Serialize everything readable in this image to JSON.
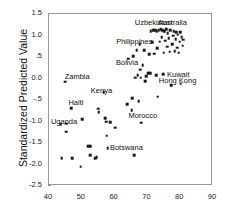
{
  "chart_data": {
    "type": "scatter",
    "title": "",
    "xlabel": "",
    "ylabel": "Standardized Predicted Value",
    "xlim": [
      40,
      90
    ],
    "ylim": [
      -2.5,
      1.5
    ],
    "xticks": [
      "40",
      "50",
      "60",
      "70",
      "80",
      "90"
    ],
    "xtick_values": [
      40,
      50,
      60,
      70,
      80,
      90
    ],
    "yticks": [
      "1.5",
      "1.0",
      ".5",
      "0.0",
      "-.5",
      "-1.0",
      "-1.5",
      "-2.0",
      "-2.5"
    ],
    "ytick_values": [
      1.5,
      1.0,
      0.5,
      0.0,
      -0.5,
      -1.0,
      -1.5,
      -2.0,
      -2.5
    ],
    "grid": false,
    "legend": false,
    "marker_color": "#1a1a1a",
    "frame_color": "#9a9a9a",
    "points": [
      {
        "x": 43.6,
        "y": -1.06
      },
      {
        "x": 43.9,
        "y": -1.85
      },
      {
        "x": 45.0,
        "y": -0.07
      },
      {
        "x": 45.2,
        "y": -1.05
      },
      {
        "x": 45.3,
        "y": -1.24
      },
      {
        "x": 46.8,
        "y": -0.69
      },
      {
        "x": 47.0,
        "y": -1.85
      },
      {
        "x": 49.7,
        "y": -2.05
      },
      {
        "x": 50.1,
        "y": -0.94
      },
      {
        "x": 52.0,
        "y": -1.57
      },
      {
        "x": 52.5,
        "y": -1.57
      },
      {
        "x": 52.6,
        "y": -1.79
      },
      {
        "x": 54.0,
        "y": -1.85
      },
      {
        "x": 54.5,
        "y": -1.83
      },
      {
        "x": 55.0,
        "y": -0.7
      },
      {
        "x": 55.2,
        "y": -0.78
      },
      {
        "x": 56.7,
        "y": -0.32
      },
      {
        "x": 57.2,
        "y": -0.92
      },
      {
        "x": 57.4,
        "y": -1.0
      },
      {
        "x": 57.6,
        "y": -1.33
      },
      {
        "x": 57.9,
        "y": -1.62
      },
      {
        "x": 58.6,
        "y": -1.02
      },
      {
        "x": 60.2,
        "y": -1.14
      },
      {
        "x": 63.8,
        "y": -0.6
      },
      {
        "x": 64.2,
        "y": 0.46
      },
      {
        "x": 65.2,
        "y": -0.74
      },
      {
        "x": 65.4,
        "y": -0.46
      },
      {
        "x": 65.6,
        "y": 0.52
      },
      {
        "x": 66.0,
        "y": -1.79
      },
      {
        "x": 66.2,
        "y": 0.02
      },
      {
        "x": 66.8,
        "y": 0.66
      },
      {
        "x": 67.0,
        "y": 0.08
      },
      {
        "x": 67.3,
        "y": -0.53
      },
      {
        "x": 67.6,
        "y": 0.8
      },
      {
        "x": 67.8,
        "y": 0.2
      },
      {
        "x": 68.0,
        "y": 0.02
      },
      {
        "x": 68.2,
        "y": -1.03
      },
      {
        "x": 68.6,
        "y": 0.31
      },
      {
        "x": 69.0,
        "y": 0.66
      },
      {
        "x": 69.4,
        "y": -0.06
      },
      {
        "x": 69.6,
        "y": 0.06
      },
      {
        "x": 70.2,
        "y": 0.12
      },
      {
        "x": 70.5,
        "y": 0.56
      },
      {
        "x": 70.8,
        "y": 0.12
      },
      {
        "x": 71.0,
        "y": 1.1
      },
      {
        "x": 71.4,
        "y": 0.84
      },
      {
        "x": 71.8,
        "y": 1.12
      },
      {
        "x": 72.0,
        "y": 0.58
      },
      {
        "x": 72.3,
        "y": 1.12
      },
      {
        "x": 72.6,
        "y": 0.08
      },
      {
        "x": 72.8,
        "y": 1.1
      },
      {
        "x": 73.0,
        "y": 0.7
      },
      {
        "x": 73.2,
        "y": -0.42
      },
      {
        "x": 73.5,
        "y": 1.12
      },
      {
        "x": 73.8,
        "y": 0.86
      },
      {
        "x": 74.0,
        "y": 1.14
      },
      {
        "x": 74.3,
        "y": 0.96
      },
      {
        "x": 74.6,
        "y": 1.12
      },
      {
        "x": 74.8,
        "y": 0.1
      },
      {
        "x": 75.0,
        "y": 0.6
      },
      {
        "x": 75.2,
        "y": 1.1
      },
      {
        "x": 75.5,
        "y": 0.88
      },
      {
        "x": 75.8,
        "y": 1.14
      },
      {
        "x": 76.0,
        "y": 0.74
      },
      {
        "x": 76.2,
        "y": 1.06
      },
      {
        "x": 76.5,
        "y": 0.94
      },
      {
        "x": 76.8,
        "y": 0.62
      },
      {
        "x": 77.0,
        "y": 1.12
      },
      {
        "x": 77.2,
        "y": -0.15
      },
      {
        "x": 77.5,
        "y": 0.8
      },
      {
        "x": 77.8,
        "y": 1.0
      },
      {
        "x": 78.0,
        "y": 1.1
      },
      {
        "x": 78.3,
        "y": 0.64
      },
      {
        "x": 78.6,
        "y": 0.92
      },
      {
        "x": 78.8,
        "y": 1.08
      },
      {
        "x": 79.0,
        "y": 0.72
      },
      {
        "x": 79.3,
        "y": 1.02
      },
      {
        "x": 79.6,
        "y": 0.6
      },
      {
        "x": 79.8,
        "y": 0.86
      },
      {
        "x": 80.0,
        "y": 1.08
      },
      {
        "x": 80.2,
        "y": -0.12
      },
      {
        "x": 80.5,
        "y": 0.96
      },
      {
        "x": 80.8,
        "y": 0.76
      },
      {
        "x": 81.0,
        "y": 0.9
      }
    ],
    "annotations": [
      {
        "label": "Uzbekistan",
        "x": 71.8,
        "y": 1.3
      },
      {
        "label": "Australia",
        "x": 77.6,
        "y": 1.3
      },
      {
        "label": "Philippines",
        "x": 66.0,
        "y": 0.86
      },
      {
        "label": "Bolivia",
        "x": 63.8,
        "y": 0.36
      },
      {
        "label": "Kuwait",
        "x": 79.4,
        "y": 0.08
      },
      {
        "label": "Hong Kong",
        "x": 79.2,
        "y": -0.06
      },
      {
        "label": "Zambia",
        "x": 48.6,
        "y": 0.04
      },
      {
        "label": "Kenya",
        "x": 56.0,
        "y": -0.3
      },
      {
        "label": "Haiti",
        "x": 48.2,
        "y": -0.58
      },
      {
        "label": "Uganda",
        "x": 44.6,
        "y": -1.0
      },
      {
        "label": "Morocco",
        "x": 68.6,
        "y": -0.88
      },
      {
        "label": "Botswana",
        "x": 63.6,
        "y": -1.61
      }
    ]
  }
}
